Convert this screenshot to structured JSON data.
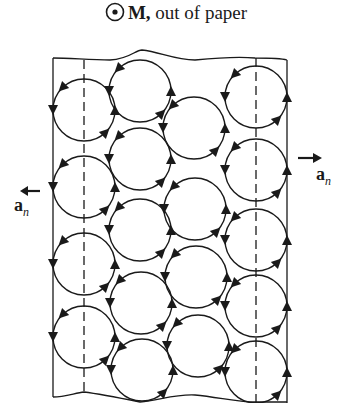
{
  "title": {
    "symbol": "dot-in-circle",
    "vector": "M,",
    "text": " out of paper"
  },
  "labels": {
    "left_normal": {
      "vector": "a",
      "subscript": "n",
      "arrow": "left"
    },
    "right_normal": {
      "vector": "a",
      "subscript": "n",
      "arrow": "right"
    }
  },
  "diagram": {
    "stroke_color": "#1a1a1a",
    "borders": {
      "left_x": 53,
      "right_x": 287,
      "top_y": 58,
      "bottom_y": 400
    },
    "dashed_lines_x": [
      84,
      256
    ],
    "circle_radius": 31,
    "rotation": "counterclockwise",
    "circles": [
      {
        "x": 84,
        "y": 110
      },
      {
        "x": 84,
        "y": 187
      },
      {
        "x": 84,
        "y": 264
      },
      {
        "x": 84,
        "y": 337
      },
      {
        "x": 140,
        "y": 91
      },
      {
        "x": 140,
        "y": 159
      },
      {
        "x": 140,
        "y": 230
      },
      {
        "x": 141,
        "y": 303
      },
      {
        "x": 142,
        "y": 370
      },
      {
        "x": 194,
        "y": 128
      },
      {
        "x": 195,
        "y": 209
      },
      {
        "x": 196,
        "y": 277
      },
      {
        "x": 198,
        "y": 346
      },
      {
        "x": 256,
        "y": 97
      },
      {
        "x": 256,
        "y": 170
      },
      {
        "x": 256,
        "y": 240
      },
      {
        "x": 256,
        "y": 306
      },
      {
        "x": 256,
        "y": 372
      }
    ]
  }
}
